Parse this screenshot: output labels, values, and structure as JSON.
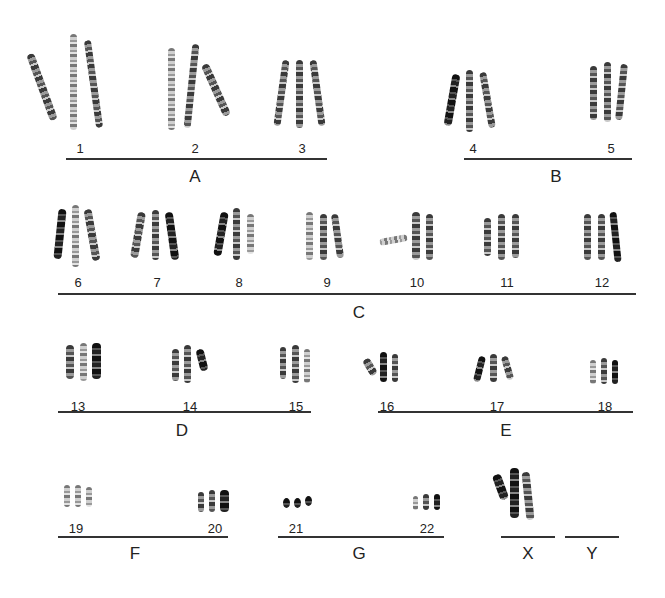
{
  "figure": {
    "type": "karyotype",
    "groups": [
      {
        "label": "A",
        "chromosomes": [
          "1",
          "2",
          "3"
        ]
      },
      {
        "label": "B",
        "chromosomes": [
          "4",
          "5"
        ]
      },
      {
        "label": "C",
        "chromosomes": [
          "6",
          "7",
          "8",
          "9",
          "10",
          "11",
          "12"
        ]
      },
      {
        "label": "D",
        "chromosomes": [
          "13",
          "14",
          "15"
        ]
      },
      {
        "label": "E",
        "chromosomes": [
          "16",
          "17",
          "18"
        ]
      },
      {
        "label": "F",
        "chromosomes": [
          "19",
          "20"
        ]
      },
      {
        "label": "G",
        "chromosomes": [
          "21",
          "22"
        ]
      },
      {
        "label": "X",
        "chromosomes": []
      },
      {
        "label": "Y",
        "chromosomes": []
      }
    ],
    "labels": {
      "c1": "1",
      "c2": "2",
      "c3": "3",
      "c4": "4",
      "c5": "5",
      "c6": "6",
      "c7": "7",
      "c8": "8",
      "c9": "9",
      "c10": "10",
      "c11": "11",
      "c12": "12",
      "c13": "13",
      "c14": "14",
      "c15": "15",
      "c16": "16",
      "c17": "17",
      "c18": "18",
      "c19": "19",
      "c20": "20",
      "c21": "21",
      "c22": "22",
      "gA": "A",
      "gB": "B",
      "gC": "C",
      "gD": "D",
      "gE": "E",
      "gF": "F",
      "gG": "G",
      "gX": "X",
      "gY": "Y"
    },
    "copies_per_chromosome": 3
  }
}
